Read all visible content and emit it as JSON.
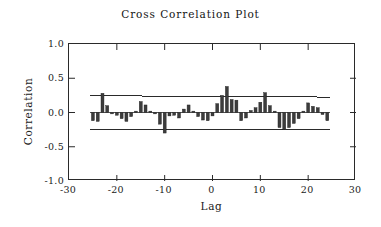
{
  "chart_data": {
    "type": "bar",
    "title": "Cross Correlation Plot",
    "xlabel": "Lag",
    "ylabel": "Correlation",
    "xlim": [
      -30,
      30
    ],
    "ylim": [
      -1.0,
      1.0
    ],
    "xticks": [
      -30,
      -20,
      -10,
      0,
      10,
      20,
      30
    ],
    "xtick_labels": [
      "-30",
      "-20",
      "-10",
      "0",
      "10",
      "20",
      "30"
    ],
    "yticks": [
      -1.0,
      -0.5,
      0.0,
      0.5,
      1.0
    ],
    "ytick_labels": [
      "-1.0",
      "-0.5",
      "0.0",
      "0.5",
      "1.0"
    ],
    "grid": false,
    "legend": null,
    "bar_color": "#3c3c3c",
    "band_color": "#2a2a2a",
    "confidence_band": {
      "upper_left": 0.245,
      "upper_right": 0.225,
      "lower_left": -0.255,
      "lower_right": -0.245,
      "description": "approximate 95% significance limits, slightly tapering with lag"
    },
    "x": [
      -25,
      -24,
      -23,
      -22,
      -21,
      -20,
      -19,
      -18,
      -17,
      -16,
      -15,
      -14,
      -13,
      -12,
      -11,
      -10,
      -9,
      -8,
      -7,
      -6,
      -5,
      -4,
      -3,
      -2,
      -1,
      0,
      1,
      2,
      3,
      4,
      5,
      6,
      7,
      8,
      9,
      10,
      11,
      12,
      13,
      14,
      15,
      16,
      17,
      18,
      19,
      20,
      21,
      22,
      23,
      24
    ],
    "values": [
      -0.12,
      -0.13,
      0.28,
      0.1,
      -0.02,
      -0.04,
      -0.09,
      -0.13,
      -0.06,
      0.02,
      0.16,
      0.11,
      0.02,
      -0.02,
      -0.17,
      -0.3,
      -0.05,
      -0.04,
      -0.08,
      0.05,
      0.11,
      0.02,
      -0.06,
      -0.11,
      -0.12,
      -0.05,
      0.13,
      0.25,
      0.38,
      0.19,
      0.18,
      -0.12,
      -0.08,
      0.03,
      0.07,
      0.15,
      0.29,
      0.1,
      0.02,
      -0.22,
      -0.25,
      -0.22,
      -0.16,
      -0.09,
      0.02,
      0.14,
      0.09,
      0.07,
      -0.03,
      -0.12
    ],
    "n_bars": 50
  },
  "chart": {
    "title": "Cross Correlation Plot",
    "xlabel": "Lag",
    "ylabel": "Correlation"
  }
}
